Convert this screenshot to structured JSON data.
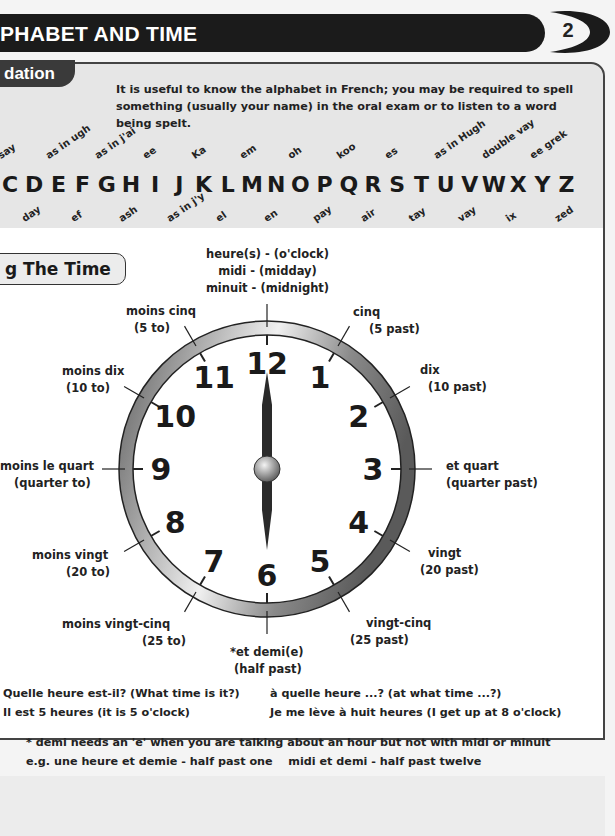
{
  "header": {
    "title": "PHABET AND TIME",
    "page_number": "2"
  },
  "alphabet": {
    "tab_label": "dation",
    "intro": "It is useful to know the alphabet in French; you may be required to spell something (usually your name) in the oral exam or to listen to a word being spelt.",
    "letters": [
      {
        "letter": "C",
        "pron": "say",
        "pos": "above"
      },
      {
        "letter": "D",
        "pron": "day",
        "pos": "below"
      },
      {
        "letter": "E",
        "pron": "as in ugh",
        "pos": "above"
      },
      {
        "letter": "F",
        "pron": "ef",
        "pos": "below"
      },
      {
        "letter": "G",
        "pron": "as in j'ai",
        "pos": "above"
      },
      {
        "letter": "H",
        "pron": "ash",
        "pos": "below"
      },
      {
        "letter": "I",
        "pron": "ee",
        "pos": "above"
      },
      {
        "letter": "J",
        "pron": "as in j'y",
        "pos": "below"
      },
      {
        "letter": "K",
        "pron": "Ka",
        "pos": "above"
      },
      {
        "letter": "L",
        "pron": "el",
        "pos": "below"
      },
      {
        "letter": "M",
        "pron": "em",
        "pos": "above"
      },
      {
        "letter": "N",
        "pron": "en",
        "pos": "below"
      },
      {
        "letter": "O",
        "pron": "oh",
        "pos": "above"
      },
      {
        "letter": "P",
        "pron": "pay",
        "pos": "below"
      },
      {
        "letter": "Q",
        "pron": "koo",
        "pos": "above"
      },
      {
        "letter": "R",
        "pron": "air",
        "pos": "below"
      },
      {
        "letter": "S",
        "pron": "es",
        "pos": "above"
      },
      {
        "letter": "T",
        "pron": "tay",
        "pos": "below"
      },
      {
        "letter": "U",
        "pron": "as in Hugh",
        "pos": "above"
      },
      {
        "letter": "V",
        "pron": "vay",
        "pos": "below"
      },
      {
        "letter": "W",
        "pron": "double vay",
        "pos": "above"
      },
      {
        "letter": "X",
        "pron": "ix",
        "pos": "below"
      },
      {
        "letter": "Y",
        "pron": "ee grek",
        "pos": "above"
      },
      {
        "letter": "Z",
        "pron": "zed",
        "pos": "below"
      }
    ]
  },
  "time": {
    "tab_label": "g The Time",
    "clock_numbers": [
      "12",
      "1",
      "2",
      "3",
      "4",
      "5",
      "6",
      "7",
      "8",
      "9",
      "10",
      "11"
    ],
    "labels": {
      "top": [
        "heure(s) - (o'clock)",
        "midi - (midday)",
        "minuit - (midnight)"
      ],
      "cinq": [
        "cinq",
        "(5 past)"
      ],
      "dix": [
        "dix",
        "(10 past)"
      ],
      "et_quart": [
        "et quart",
        "(quarter past)"
      ],
      "vingt": [
        "vingt",
        "(20 past)"
      ],
      "vingt_cinq": [
        "vingt-cinq",
        "(25 past)"
      ],
      "et_demi": [
        "*et demi(e)",
        "(half past)"
      ],
      "moins_vingt_cinq": [
        "moins vingt-cinq",
        "(25 to)"
      ],
      "moins_vingt": [
        "moins vingt",
        "(20 to)"
      ],
      "moins_le_quart": [
        "moins le quart",
        "(quarter to)"
      ],
      "moins_dix": [
        "moins dix",
        "(10 to)"
      ],
      "moins_cinq": [
        "moins cinq",
        "(5 to)"
      ]
    },
    "phrases": {
      "q1": "Quelle heure est-il? (What time is it?)",
      "a1": "Il est 5 heures (it is 5 o'clock)",
      "q2": "à quelle heure ...? (at what time ...?)",
      "a2": "Je me lève à huit heures (I get up at 8 o'clock)"
    },
    "note_line1": "* demi needs an 'e' when you are talking about an hour but not with midi or minuit",
    "note_line2": "e.g. une heure et demie - half past one    midi et demi - half past twelve"
  },
  "colors": {
    "header_bg": "#1b1b1b",
    "panel_gray": "#e6e6e6",
    "clock_rim": "#6a6a6a",
    "hands": "#2a2a2a"
  }
}
